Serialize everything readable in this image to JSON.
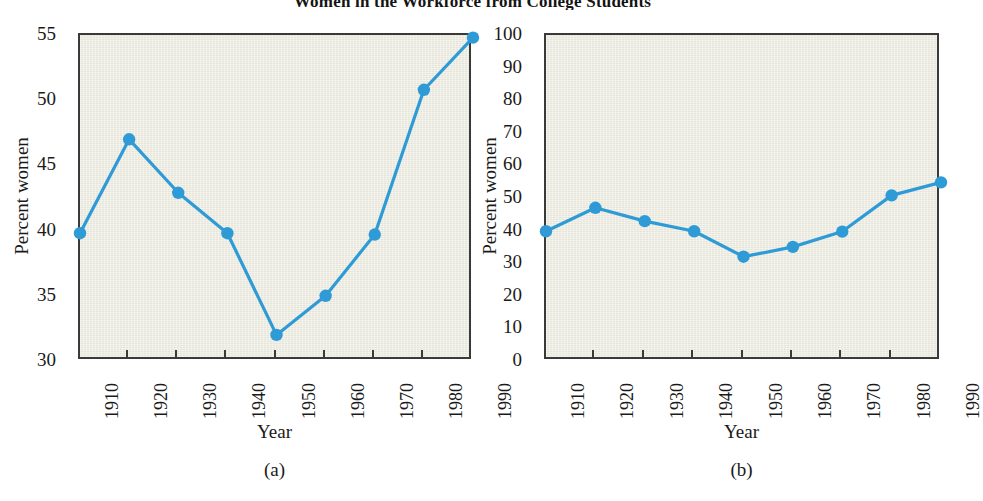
{
  "figure": {
    "title": "Women in the Workforce from College Students",
    "panels": [
      {
        "caption": "(a)"
      },
      {
        "caption": "(b)"
      }
    ]
  },
  "chart_data": [
    {
      "type": "line",
      "panel": "(a)",
      "title": "",
      "xlabel": "Year",
      "ylabel": "Percent women",
      "categories": [
        "1910",
        "1920",
        "1930",
        "1940",
        "1950",
        "1960",
        "1970",
        "1980",
        "1990"
      ],
      "x": [
        1910,
        1920,
        1930,
        1940,
        1950,
        1960,
        1970,
        1980,
        1990
      ],
      "values": [
        39.8,
        47.0,
        42.9,
        39.8,
        32.0,
        35.0,
        39.7,
        50.8,
        54.8
      ],
      "ylim": [
        30,
        55
      ],
      "yticks": [
        30,
        35,
        40,
        45,
        50,
        55
      ],
      "xlim": [
        1910,
        1990
      ],
      "grid": false,
      "legend": "none",
      "marker": "circle",
      "series_color": "#2e9bd6",
      "plot_background": "#ecebe0",
      "axis_color": "#3a3a38"
    },
    {
      "type": "line",
      "panel": "(b)",
      "title": "",
      "xlabel": "Year",
      "ylabel": "Percent women",
      "categories": [
        "1910",
        "1920",
        "1930",
        "1940",
        "1950",
        "1960",
        "1970",
        "1980",
        "1990"
      ],
      "x": [
        1910,
        1920,
        1930,
        1940,
        1950,
        1960,
        1970,
        1980,
        1990
      ],
      "values": [
        39.8,
        47.0,
        42.9,
        39.8,
        32.0,
        35.0,
        39.7,
        50.8,
        54.8
      ],
      "ylim": [
        0,
        100
      ],
      "yticks": [
        0,
        10,
        20,
        30,
        40,
        50,
        60,
        70,
        80,
        90,
        100
      ],
      "xlim": [
        1910,
        1990
      ],
      "grid": false,
      "legend": "none",
      "marker": "circle",
      "series_color": "#2e9bd6",
      "plot_background": "#ecebe0",
      "axis_color": "#3a3a38"
    }
  ]
}
